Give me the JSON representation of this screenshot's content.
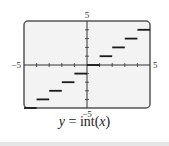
{
  "chart_data": {
    "type": "line",
    "subtype": "step",
    "title": "y = int(x)",
    "caption_plain": "y = int(x)",
    "xlabel": "",
    "ylabel": "",
    "xlim": [
      -5,
      5
    ],
    "ylim": [
      -5,
      5
    ],
    "x_tick_step": 1,
    "y_tick_step": 1,
    "grid": false,
    "axis_labels": {
      "x_min": "−5",
      "x_max": "5",
      "y_min": "−5",
      "y_max": "5"
    },
    "segments": [
      {
        "x_start": -5,
        "x_end": -4,
        "y": -5
      },
      {
        "x_start": -4,
        "x_end": -3,
        "y": -4
      },
      {
        "x_start": -3,
        "x_end": -2,
        "y": -3
      },
      {
        "x_start": -2,
        "x_end": -1,
        "y": -2
      },
      {
        "x_start": -1,
        "x_end": 0,
        "y": -1
      },
      {
        "x_start": 0,
        "x_end": 1,
        "y": 0
      },
      {
        "x_start": 1,
        "x_end": 2,
        "y": 1
      },
      {
        "x_start": 2,
        "x_end": 3,
        "y": 2
      },
      {
        "x_start": 3,
        "x_end": 4,
        "y": 3
      },
      {
        "x_start": 4,
        "x_end": 5,
        "y": 4
      }
    ]
  },
  "caption": {
    "lhs": "y",
    "eq": " = int(",
    "arg": "x",
    "close": ")"
  },
  "colors": {
    "screen_bg": "#f3f3f3",
    "frame": "#555555",
    "axis": "#333333",
    "step": "#1a1a1a",
    "label": "#333333"
  }
}
